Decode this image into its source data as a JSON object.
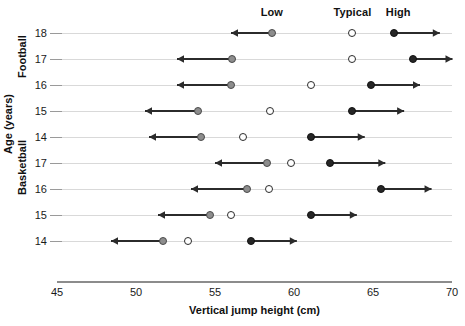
{
  "chart_data": {
    "type": "scatter",
    "title": "",
    "xlabel": "Vertical jump height (cm)",
    "ylabel": "Age (years)",
    "xlim": [
      45,
      70
    ],
    "xticks": [
      45,
      50,
      55,
      60,
      65,
      70
    ],
    "grid": true,
    "legend_position": "top",
    "column_headers": [
      {
        "label": "Low",
        "x": 58.6
      },
      {
        "label": "Typical",
        "x": 63.7
      },
      {
        "label": "High",
        "x": 66.6
      }
    ],
    "series": [
      {
        "name": "Low",
        "marker": "filled-gray-circle",
        "color": "#8d8d8d",
        "arrow_direction": "left"
      },
      {
        "name": "Typical",
        "marker": "open-circle",
        "color": "#ffffff",
        "arrow_direction": "none"
      },
      {
        "name": "High",
        "marker": "filled-black-circle",
        "color": "#262626",
        "arrow_direction": "right"
      }
    ],
    "groups": [
      {
        "name": "Football",
        "rows": [
          {
            "age": "18",
            "low": 58.6,
            "typical": 63.7,
            "high": 66.3,
            "low_arrow_end": 56.0,
            "high_arrow_end": 69.2
          },
          {
            "age": "17",
            "low": 56.1,
            "typical": 63.7,
            "high": 67.5,
            "low_arrow_end": 52.6,
            "high_arrow_end": 70.0
          },
          {
            "age": "16",
            "low": 56.0,
            "typical": 61.1,
            "high": 64.9,
            "low_arrow_end": 52.6,
            "high_arrow_end": 68.0
          },
          {
            "age": "15",
            "low": 53.9,
            "typical": 58.5,
            "high": 63.7,
            "low_arrow_end": 50.6,
            "high_arrow_end": 67.0
          }
        ]
      },
      {
        "name": "Basketball",
        "rows": [
          {
            "age": "14",
            "low": 54.1,
            "typical": 56.8,
            "high": 61.1,
            "low_arrow_end": 50.8,
            "high_arrow_end": 64.5
          },
          {
            "age": "17",
            "low": 58.3,
            "typical": 59.8,
            "high": 62.3,
            "low_arrow_end": 55.0,
            "high_arrow_end": 65.8
          },
          {
            "age": "16",
            "low": 57.0,
            "typical": 58.4,
            "high": 65.5,
            "low_arrow_end": 53.5,
            "high_arrow_end": 68.7
          },
          {
            "age": "15",
            "low": 54.7,
            "typical": 56.0,
            "high": 61.1,
            "low_arrow_end": 51.4,
            "high_arrow_end": 64.0
          },
          {
            "age": "14",
            "low": 51.7,
            "typical": 53.3,
            "high": 57.3,
            "low_arrow_end": 48.4,
            "high_arrow_end": 60.2
          }
        ]
      }
    ]
  }
}
